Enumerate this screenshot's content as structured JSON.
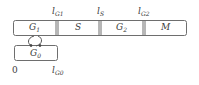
{
  "diagram": {
    "type": "cell-cycle-phases",
    "main_bar": {
      "phases": [
        {
          "id": "G1",
          "label": "G",
          "sub": "1"
        },
        {
          "id": "S",
          "label": "S",
          "sub": ""
        },
        {
          "id": "G2",
          "label": "G",
          "sub": "2"
        },
        {
          "id": "M",
          "label": "M",
          "sub": ""
        }
      ]
    },
    "branch_box": {
      "id": "G0",
      "label": "G",
      "sub": "0"
    },
    "boundaries": [
      {
        "label": "l",
        "sub": "G1"
      },
      {
        "label": "l",
        "sub": "S"
      },
      {
        "label": "l",
        "sub": "G2"
      }
    ],
    "axis": {
      "origin": "0",
      "g0_end": {
        "label": "l",
        "sub": "G0"
      }
    },
    "connector": "bidirectional-curved-arrows-G1-G0",
    "colors": {
      "stroke": "#6e6e6e",
      "text": "#3a3a3a",
      "background": "#ffffff"
    }
  }
}
